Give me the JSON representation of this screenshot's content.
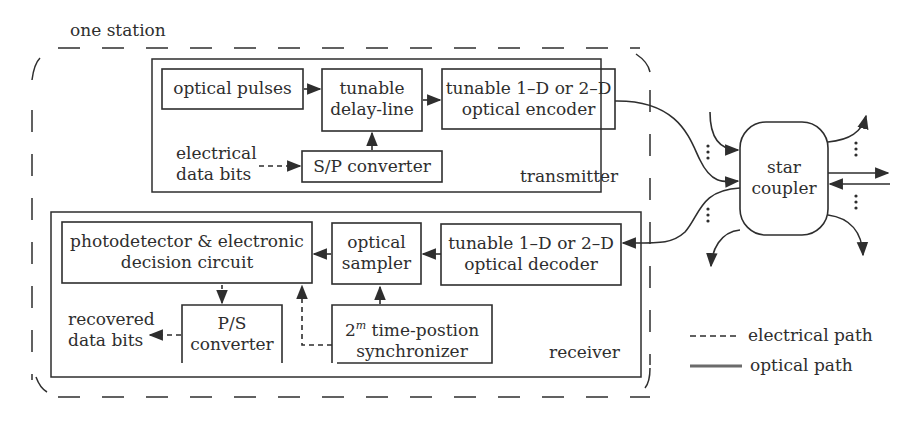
{
  "station": {
    "label": "one station"
  },
  "transmitter": {
    "label": "transmitter",
    "blocks": {
      "optical_pulses": "optical pulses",
      "delay_line": [
        "tunable",
        "delay-line"
      ],
      "encoder": [
        "tunable 1–D or 2–D",
        "optical encoder"
      ],
      "sp_converter": "S/P converter"
    },
    "input_label": [
      "electrical",
      "data bits"
    ]
  },
  "receiver": {
    "label": "receiver",
    "blocks": {
      "photodetector": [
        "photodetector & electronic",
        "decision circuit"
      ],
      "sampler": [
        "optical",
        "sampler"
      ],
      "decoder": [
        "tunable 1–D or 2–D",
        "optical decoder"
      ],
      "ps_converter": [
        "P/S",
        "converter"
      ],
      "synchronizer_base": "2",
      "synchronizer_exp": "m",
      "synchronizer": [
        " time-postion",
        "synchronizer"
      ]
    },
    "output_label": [
      "recovered",
      "data bits"
    ]
  },
  "star_coupler": [
    "star",
    "coupler"
  ],
  "legend": {
    "electrical": "electrical path",
    "optical": "optical path"
  },
  "colors": {
    "line": "#2e2e2e",
    "optical_legend": "#6b6b6b"
  }
}
